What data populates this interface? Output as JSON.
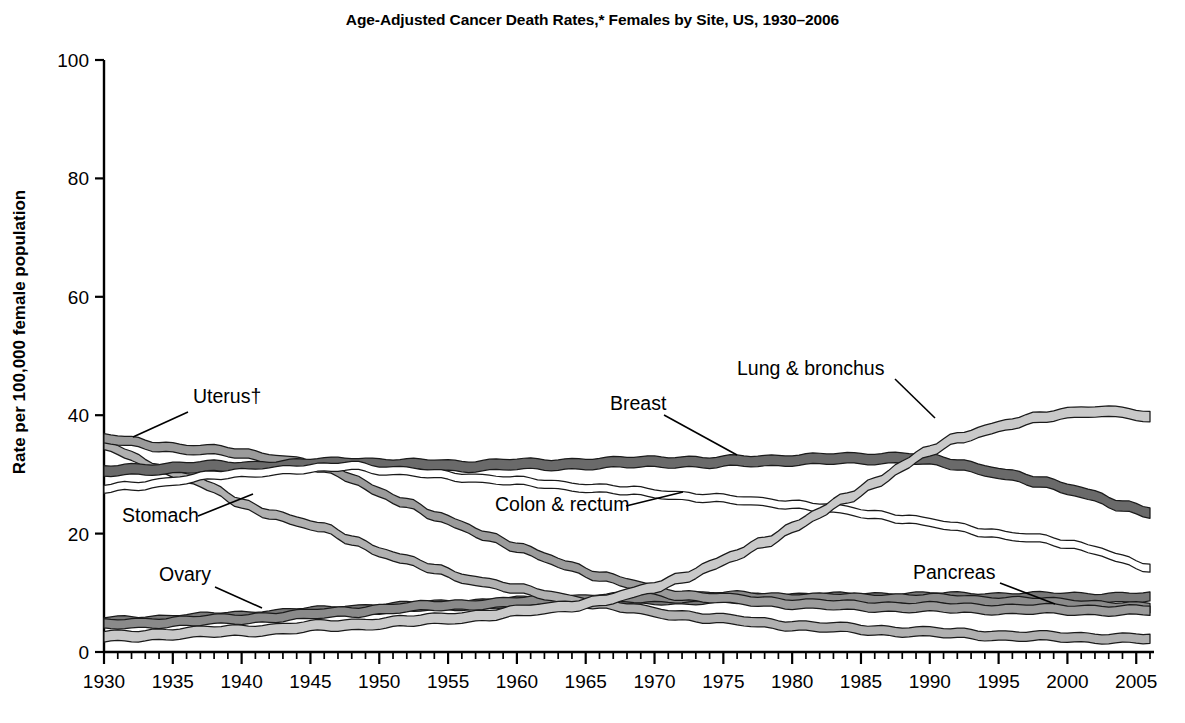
{
  "chart_data": {
    "type": "line",
    "title": "Age-Adjusted Cancer Death Rates,* Females by Site, US, 1930–2006",
    "xlabel": "",
    "ylabel": "Rate per 100,000 female population",
    "xlim": [
      1930,
      2006
    ],
    "ylim": [
      0,
      100
    ],
    "yticks": [
      0,
      20,
      40,
      60,
      80,
      100
    ],
    "ytick_labels": [
      "0",
      "20",
      "40",
      "60",
      "80",
      "100"
    ],
    "xticks": [
      1930,
      1935,
      1940,
      1945,
      1950,
      1955,
      1960,
      1965,
      1970,
      1975,
      1980,
      1985,
      1990,
      1995,
      2000,
      2005
    ],
    "xtick_labels": [
      "1930",
      "1935",
      "1940",
      "1945",
      "1950",
      "1955",
      "1960",
      "1965",
      "1970",
      "1975",
      "1980",
      "1985",
      "1990",
      "1995",
      "2000",
      "2005"
    ],
    "minor_xtick_step": 1,
    "grid": false,
    "legend": "inline-annotations",
    "x": [
      1930,
      1932,
      1934,
      1936,
      1938,
      1940,
      1942,
      1944,
      1946,
      1948,
      1950,
      1952,
      1954,
      1956,
      1958,
      1960,
      1962,
      1964,
      1966,
      1968,
      1970,
      1972,
      1974,
      1976,
      1978,
      1980,
      1982,
      1984,
      1986,
      1988,
      1990,
      1992,
      1994,
      1996,
      1998,
      2000,
      2002,
      2004,
      2006
    ],
    "series": [
      {
        "name": "Lung & bronchus",
        "color": "#c9c9c9",
        "style": "light-gray band",
        "values": [
          2.5,
          2.7,
          3.0,
          3.2,
          3.4,
          3.6,
          3.8,
          4.1,
          4.4,
          4.6,
          4.9,
          5.2,
          5.5,
          5.9,
          6.3,
          6.8,
          7.3,
          7.9,
          8.6,
          9.6,
          11.0,
          12.6,
          14.4,
          16.4,
          18.6,
          21.0,
          23.5,
          26.0,
          28.5,
          31.5,
          34.0,
          36.0,
          37.5,
          38.7,
          39.5,
          40.3,
          40.8,
          40.5,
          39.5
        ]
      },
      {
        "name": "Breast",
        "color": "#6a6a6a",
        "style": "dark-gray band",
        "values": [
          30.5,
          30.8,
          31.0,
          31.2,
          31.3,
          31.2,
          31.4,
          31.6,
          31.8,
          32.0,
          31.8,
          31.6,
          31.6,
          31.4,
          31.6,
          31.7,
          31.6,
          31.8,
          31.9,
          32.0,
          32.1,
          32.2,
          32.0,
          32.2,
          32.3,
          32.5,
          32.6,
          32.6,
          32.7,
          32.9,
          32.4,
          31.6,
          30.8,
          29.8,
          28.6,
          27.6,
          26.4,
          24.6,
          23.5
        ]
      },
      {
        "name": "Uterus",
        "color": "#9b9b9b",
        "style": "medium-gray band",
        "values": [
          36.0,
          35.5,
          34.8,
          34.2,
          34.0,
          33.6,
          32.8,
          32.0,
          31.0,
          29.5,
          27.0,
          25.0,
          23.0,
          21.4,
          19.4,
          17.6,
          16.0,
          14.4,
          12.8,
          11.6,
          10.4,
          9.6,
          9.2,
          8.8,
          8.5,
          8.2,
          8.0,
          7.8,
          7.7,
          7.6,
          7.5,
          7.4,
          7.3,
          7.2,
          7.2,
          7.1,
          7.1,
          7.0,
          7.0
        ]
      },
      {
        "name": "Stomach",
        "color": "#b0b0b0",
        "style": "light-medium-gray band",
        "values": [
          35.0,
          33.0,
          31.0,
          29.5,
          27.5,
          25.0,
          23.5,
          22.0,
          20.8,
          19.0,
          17.0,
          15.4,
          14.0,
          12.6,
          11.6,
          10.6,
          9.7,
          8.8,
          8.1,
          7.4,
          6.7,
          6.2,
          5.7,
          5.3,
          4.9,
          4.5,
          4.2,
          4.0,
          3.7,
          3.5,
          3.3,
          3.1,
          2.9,
          2.7,
          2.6,
          2.5,
          2.4,
          2.3,
          2.2
        ]
      },
      {
        "name": "Colon & rectum",
        "color": "#ffffff",
        "style": "white outlined band",
        "values": [
          27.5,
          28.0,
          28.6,
          29.2,
          29.8,
          30.2,
          30.6,
          30.8,
          31.0,
          31.6,
          30.8,
          30.4,
          30.0,
          29.6,
          29.2,
          28.8,
          28.4,
          28.0,
          27.6,
          27.2,
          26.8,
          26.4,
          26.0,
          25.6,
          25.3,
          25.0,
          24.4,
          23.8,
          23.2,
          22.6,
          21.8,
          21.0,
          20.3,
          19.6,
          19.0,
          18.2,
          17.4,
          15.6,
          14.0
        ]
      },
      {
        "name": "Pancreas",
        "color": "#787878",
        "style": "dark-gray band",
        "values": [
          5.0,
          5.2,
          5.4,
          5.6,
          5.8,
          6.0,
          6.3,
          6.6,
          6.8,
          7.1,
          7.4,
          7.6,
          7.8,
          8.0,
          8.2,
          8.4,
          8.5,
          8.6,
          8.7,
          8.8,
          8.9,
          8.9,
          9.0,
          9.0,
          9.0,
          9.1,
          9.1,
          9.1,
          9.2,
          9.2,
          9.2,
          9.2,
          9.2,
          9.2,
          9.2,
          9.2,
          9.2,
          9.2,
          9.2
        ]
      },
      {
        "name": "Ovary",
        "color": "#8a8a8a",
        "style": "gray band",
        "values": [
          4.6,
          4.8,
          5.0,
          5.2,
          5.4,
          5.6,
          5.9,
          6.2,
          6.5,
          6.8,
          7.2,
          7.5,
          7.8,
          8.0,
          8.2,
          8.4,
          8.6,
          8.8,
          9.0,
          9.1,
          9.2,
          9.3,
          9.3,
          9.3,
          9.2,
          9.1,
          9.0,
          9.0,
          9.0,
          9.0,
          8.9,
          8.8,
          8.6,
          8.5,
          8.3,
          8.1,
          7.9,
          7.6,
          7.4
        ]
      }
    ],
    "annotations": [
      {
        "label": "Uterus†",
        "x_text": 193,
        "y_text": 403,
        "leader": [
          [
            188,
            412
          ],
          [
            133,
            437
          ]
        ]
      },
      {
        "label": "Stomach",
        "x_text": 122,
        "y_text": 522,
        "leader": [
          [
            198,
            516
          ],
          [
            253,
            494
          ]
        ]
      },
      {
        "label": "Ovary",
        "x_text": 159,
        "y_text": 581,
        "leader": [
          [
            215,
            587
          ],
          [
            262,
            608
          ]
        ]
      },
      {
        "label": "Breast",
        "x_text": 610,
        "y_text": 410,
        "leader": [
          [
            664,
            415
          ],
          [
            737,
            455
          ]
        ]
      },
      {
        "label": "Lung & bronchus",
        "x_text": 737,
        "y_text": 375,
        "leader": [
          [
            895,
            379
          ],
          [
            935,
            418
          ]
        ]
      },
      {
        "label": "Colon & rectum",
        "x_text": 495,
        "y_text": 511,
        "leader": [
          [
            626,
            506
          ],
          [
            683,
            492
          ]
        ]
      },
      {
        "label": "Pancreas",
        "x_text": 913,
        "y_text": 579,
        "leader": [
          [
            1000,
            583
          ],
          [
            1055,
            604
          ]
        ]
      }
    ]
  }
}
